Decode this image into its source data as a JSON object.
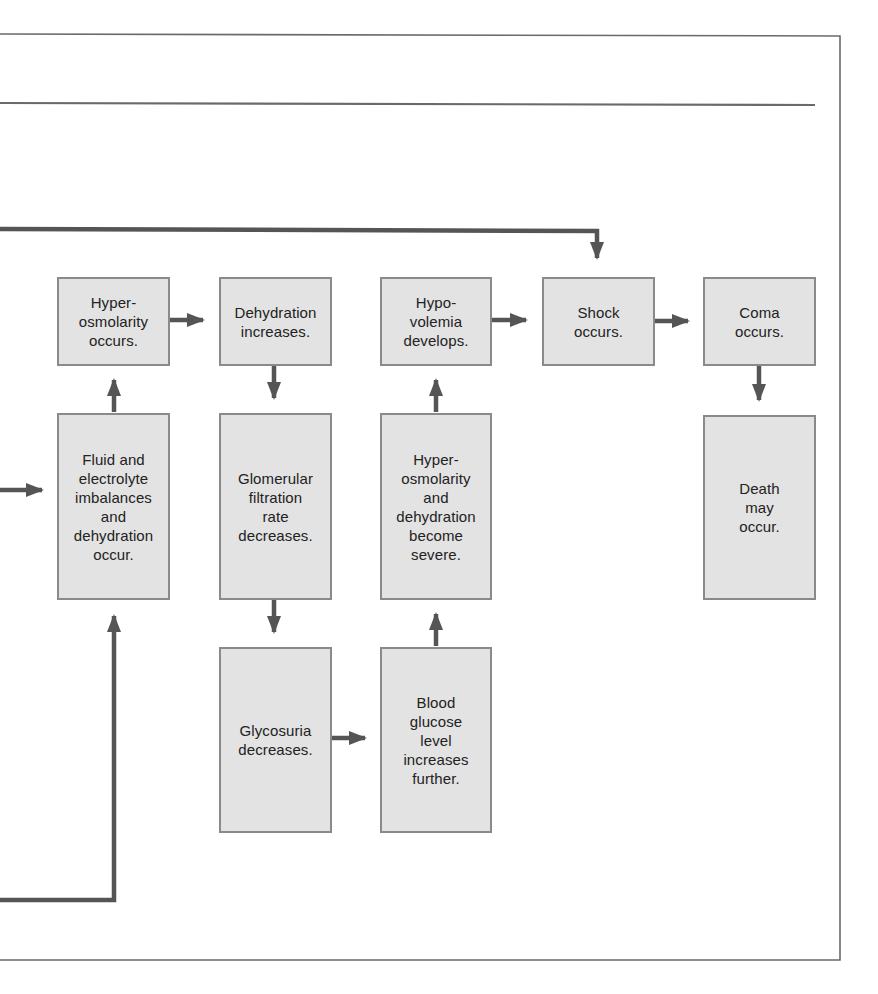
{
  "diagram": {
    "type": "flowchart",
    "colors": {
      "box_fill": "#e3e3e3",
      "box_border": "#8a8a8a",
      "arrow": "#555555",
      "frame": "#666666",
      "text": "#222222"
    },
    "nodes": [
      {
        "id": "hyperosmolarity",
        "label": "Hyper-\nosmolarity\noccurs."
      },
      {
        "id": "dehydration_increases",
        "label": "Dehydration\nincreases."
      },
      {
        "id": "hypovolemia",
        "label": "Hypo-\nvolemia\ndevelops."
      },
      {
        "id": "shock",
        "label": "Shock\noccurs."
      },
      {
        "id": "coma",
        "label": "Coma\noccurs."
      },
      {
        "id": "fluid_electrolyte",
        "label": "Fluid and\nelectrolyte\nimbalances\nand\ndehydration\noccur."
      },
      {
        "id": "gfr_decreases",
        "label": "Glomerular\nfiltration\nrate\ndecreases."
      },
      {
        "id": "hyperosmolarity_severe",
        "label": "Hyper-\nosmolarity\nand\ndehydration\nbecome\nsevere."
      },
      {
        "id": "death",
        "label": "Death\nmay\noccur."
      },
      {
        "id": "glycosuria_decreases",
        "label": "Glycosuria\ndecreases."
      },
      {
        "id": "blood_glucose",
        "label": "Blood\nglucose\nlevel\nincreases\nfurther."
      }
    ],
    "edges": [
      {
        "from": "hyperosmolarity",
        "to": "dehydration_increases"
      },
      {
        "from": "hypovolemia",
        "to": "shock"
      },
      {
        "from": "shock",
        "to": "coma"
      },
      {
        "from": "fluid_electrolyte",
        "to": "hyperosmolarity"
      },
      {
        "from": "dehydration_increases",
        "to": "gfr_decreases"
      },
      {
        "from": "hyperosmolarity_severe",
        "to": "hypovolemia"
      },
      {
        "from": "coma",
        "to": "death"
      },
      {
        "from": "gfr_decreases",
        "to": "glycosuria_decreases"
      },
      {
        "from": "blood_glucose",
        "to": "hyperosmolarity_severe"
      },
      {
        "from": "glycosuria_decreases",
        "to": "blood_glucose"
      },
      {
        "from": "offscreen-left-top",
        "to": "shock"
      },
      {
        "from": "offscreen-left-middle",
        "to": "fluid_electrolyte"
      },
      {
        "from": "offscreen-left-bottom",
        "to": "fluid_electrolyte"
      }
    ]
  }
}
